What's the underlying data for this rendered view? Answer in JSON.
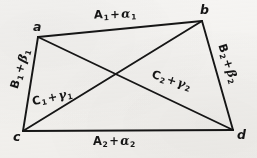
{
  "figure": {
    "type": "geometry-diagram",
    "shape": "quadrilateral-with-diagonals",
    "background_color": "#f6f5f3",
    "stroke_color": "#161616",
    "vertices": [
      {
        "id": "a",
        "label": "a",
        "x": 38,
        "y": 37
      },
      {
        "id": "b",
        "label": "b",
        "x": 202,
        "y": 21
      },
      {
        "id": "c",
        "label": "c",
        "x": 23,
        "y": 131
      },
      {
        "id": "d",
        "label": "d",
        "x": 233,
        "y": 130
      }
    ],
    "diagonal_intersection": {
      "x": 117,
      "y": 74
    },
    "edges": [
      {
        "id": "ab",
        "from": "a",
        "to": "b",
        "kind": "side",
        "label_id": "top"
      },
      {
        "id": "cd",
        "from": "c",
        "to": "d",
        "kind": "side",
        "label_id": "bottom"
      },
      {
        "id": "ac",
        "from": "a",
        "to": "c",
        "kind": "side",
        "label_id": "left"
      },
      {
        "id": "bd",
        "from": "b",
        "to": "d",
        "kind": "side",
        "label_id": "right"
      },
      {
        "id": "cb",
        "from": "c",
        "to": "b",
        "kind": "diagonal",
        "label_id": "diag-left"
      },
      {
        "id": "ad",
        "from": "a",
        "to": "d",
        "kind": "diagonal",
        "label_id": "diag-right"
      }
    ],
    "labels": {
      "top": {
        "base": "A",
        "base_sub": "1",
        "op": "+",
        "greek": "α",
        "greek_sub": "1",
        "text": "A₁ + α₁"
      },
      "bottom": {
        "base": "A",
        "base_sub": "2",
        "op": "+",
        "greek": "α",
        "greek_sub": "2",
        "text": "A₂ + α₂"
      },
      "left": {
        "base": "B",
        "base_sub": "1",
        "op": "+",
        "greek": "β",
        "greek_sub": "1",
        "text": "B₁ + β₁"
      },
      "right": {
        "base": "B",
        "base_sub": "2",
        "op": "+",
        "greek": "β",
        "greek_sub": "2",
        "text": "B₂ + β₂"
      },
      "diag_left": {
        "base": "C",
        "base_sub": "1",
        "op": "+",
        "greek": "γ",
        "greek_sub": "1",
        "text": "C₁ + γ₁"
      },
      "diag_right": {
        "base": "C",
        "base_sub": "2",
        "op": "+",
        "greek": "γ",
        "greek_sub": "2",
        "text": "C₂ + γ₂"
      }
    }
  }
}
